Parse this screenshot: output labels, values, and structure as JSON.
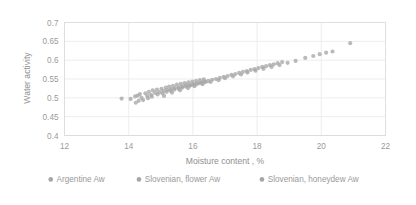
{
  "chart_data": {
    "type": "scatter",
    "title": "",
    "xlabel": "Moisture content , %",
    "ylabel": "Water activity",
    "xlim": [
      12,
      22
    ],
    "ylim": [
      0.4,
      0.7
    ],
    "xticks": [
      "12",
      "14",
      "16",
      "18",
      "20",
      "22"
    ],
    "yticks": [
      "0.4",
      "0.45",
      "0.5",
      "0.55",
      "0.6",
      "0.65",
      "0.7"
    ],
    "grid": "horizontal-and-vertical",
    "legend_position": "bottom",
    "marker_color": "#a6a6a6",
    "marker_size": 4.2,
    "series": [
      {
        "name": "Argentine Aw",
        "color": "#a6a6a6",
        "points": [
          [
            13.78,
            0.498
          ],
          [
            14.06,
            0.497
          ],
          [
            14.2,
            0.504
          ],
          [
            14.22,
            0.487
          ],
          [
            14.28,
            0.506
          ],
          [
            14.31,
            0.492
          ],
          [
            14.35,
            0.51
          ],
          [
            14.4,
            0.5
          ],
          [
            14.52,
            0.512
          ],
          [
            14.58,
            0.505
          ],
          [
            14.63,
            0.516
          ],
          [
            14.7,
            0.508
          ],
          [
            14.75,
            0.52
          ],
          [
            14.82,
            0.513
          ],
          [
            14.88,
            0.522
          ],
          [
            14.95,
            0.515
          ],
          [
            15.02,
            0.524
          ],
          [
            15.08,
            0.518
          ],
          [
            15.15,
            0.527
          ],
          [
            15.2,
            0.521
          ],
          [
            15.26,
            0.53
          ],
          [
            15.32,
            0.523
          ],
          [
            15.38,
            0.532
          ],
          [
            15.44,
            0.526
          ],
          [
            15.5,
            0.535
          ],
          [
            15.56,
            0.528
          ],
          [
            15.62,
            0.537
          ],
          [
            15.68,
            0.53
          ],
          [
            15.74,
            0.539
          ],
          [
            15.8,
            0.533
          ],
          [
            15.86,
            0.541
          ],
          [
            15.92,
            0.534
          ],
          [
            15.98,
            0.543
          ],
          [
            16.04,
            0.536
          ],
          [
            16.1,
            0.545
          ],
          [
            16.16,
            0.538
          ],
          [
            16.22,
            0.547
          ],
          [
            16.28,
            0.54
          ],
          [
            16.34,
            0.549
          ],
          [
            16.4,
            0.542
          ]
        ]
      },
      {
        "name": "Slovenian, flower Aw",
        "color": "#a6a6a6",
        "points": [
          [
            14.45,
            0.494
          ],
          [
            14.6,
            0.499
          ],
          [
            14.72,
            0.503
          ],
          [
            14.9,
            0.509
          ],
          [
            15.05,
            0.512
          ],
          [
            15.18,
            0.516
          ],
          [
            15.3,
            0.519
          ],
          [
            15.42,
            0.522
          ],
          [
            15.55,
            0.524
          ],
          [
            15.66,
            0.527
          ],
          [
            15.78,
            0.53
          ],
          [
            15.9,
            0.532
          ],
          [
            16.0,
            0.535
          ],
          [
            16.12,
            0.537
          ],
          [
            16.24,
            0.54
          ],
          [
            16.36,
            0.543
          ],
          [
            16.48,
            0.545
          ],
          [
            16.6,
            0.548
          ],
          [
            16.72,
            0.55
          ],
          [
            16.84,
            0.553
          ],
          [
            16.96,
            0.556
          ],
          [
            17.08,
            0.558
          ],
          [
            17.2,
            0.561
          ],
          [
            17.32,
            0.563
          ],
          [
            17.44,
            0.566
          ],
          [
            17.56,
            0.569
          ],
          [
            17.68,
            0.571
          ],
          [
            17.8,
            0.574
          ],
          [
            17.92,
            0.576
          ],
          [
            18.04,
            0.579
          ],
          [
            18.16,
            0.582
          ],
          [
            18.28,
            0.584
          ],
          [
            18.4,
            0.587
          ],
          [
            18.52,
            0.589
          ],
          [
            18.64,
            0.592
          ],
          [
            18.78,
            0.595
          ]
        ]
      },
      {
        "name": "Slovenian, honeydew Aw",
        "color": "#a6a6a6",
        "points": [
          [
            15.1,
            0.505
          ],
          [
            15.35,
            0.514
          ],
          [
            15.6,
            0.52
          ],
          [
            15.85,
            0.526
          ],
          [
            16.05,
            0.531
          ],
          [
            16.3,
            0.536
          ],
          [
            16.55,
            0.542
          ],
          [
            16.8,
            0.547
          ],
          [
            17.0,
            0.552
          ],
          [
            17.25,
            0.557
          ],
          [
            17.5,
            0.562
          ],
          [
            17.7,
            0.567
          ],
          [
            17.95,
            0.572
          ],
          [
            18.2,
            0.577
          ],
          [
            18.45,
            0.582
          ],
          [
            18.7,
            0.587
          ],
          [
            18.95,
            0.593
          ],
          [
            19.2,
            0.598
          ],
          [
            19.5,
            0.606
          ],
          [
            19.75,
            0.611
          ],
          [
            19.95,
            0.616
          ],
          [
            20.15,
            0.62
          ],
          [
            20.35,
            0.623
          ],
          [
            20.9,
            0.645
          ]
        ]
      }
    ],
    "legend": [
      {
        "label": "Argentine Aw",
        "color": "#a6a6a6"
      },
      {
        "label": "Slovenian, flower Aw",
        "color": "#a6a6a6"
      },
      {
        "label": "Slovenian, honeydew Aw",
        "color": "#a6a6a6"
      }
    ]
  }
}
